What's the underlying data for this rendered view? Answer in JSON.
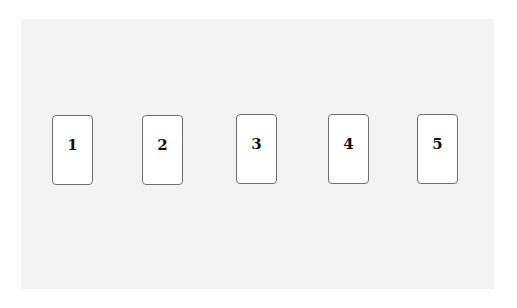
{
  "cards": [
    {
      "label": "1",
      "x": 52,
      "y": 115
    },
    {
      "label": "2",
      "x": 142,
      "y": 115
    },
    {
      "label": "3",
      "x": 236,
      "y": 114
    },
    {
      "label": "4",
      "x": 328,
      "y": 114
    },
    {
      "label": "5",
      "x": 417,
      "y": 114
    }
  ]
}
